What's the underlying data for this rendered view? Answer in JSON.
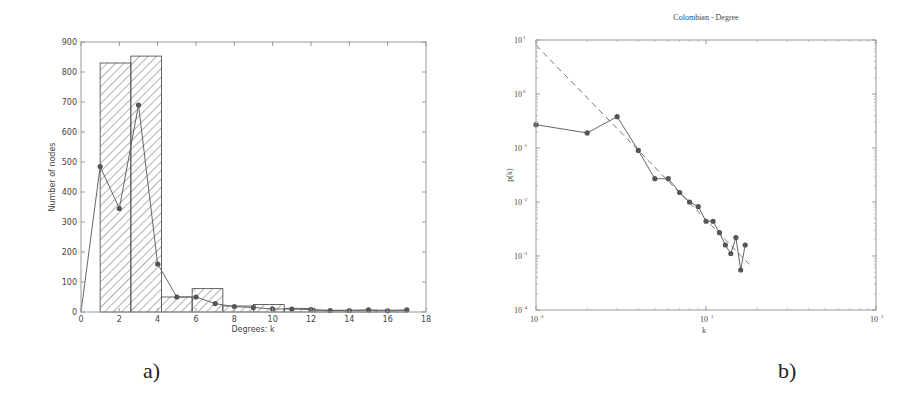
{
  "panels": {
    "a_label": "a)",
    "b_label": "b)"
  },
  "chart_data": [
    {
      "type": "bar",
      "panel": "a)",
      "title": "",
      "xlabel": "Degrees: k",
      "ylabel": "Number of nodes",
      "xlim": [
        0,
        18
      ],
      "ylim": [
        0,
        900
      ],
      "xticks": [
        0,
        2,
        4,
        6,
        8,
        10,
        12,
        14,
        16,
        18
      ],
      "yticks": [
        0,
        100,
        200,
        300,
        400,
        500,
        600,
        700,
        800,
        900
      ],
      "grid": false,
      "histogram": {
        "style": "hatched",
        "bins": [
          {
            "x0": 1.0,
            "x1": 2.6,
            "value": 830
          },
          {
            "x0": 2.6,
            "x1": 4.2,
            "value": 853
          },
          {
            "x0": 4.2,
            "x1": 5.8,
            "value": 50
          },
          {
            "x0": 5.8,
            "x1": 7.4,
            "value": 78
          },
          {
            "x0": 7.4,
            "x1": 9.0,
            "value": 20
          },
          {
            "x0": 9.0,
            "x1": 10.6,
            "value": 25
          },
          {
            "x0": 10.6,
            "x1": 12.2,
            "value": 12
          },
          {
            "x0": 12.2,
            "x1": 13.8,
            "value": 6
          },
          {
            "x0": 13.8,
            "x1": 15.4,
            "value": 6
          },
          {
            "x0": 15.4,
            "x1": 17.0,
            "value": 6
          }
        ]
      },
      "series": [
        {
          "name": "degree count",
          "x": [
            0,
            1,
            2,
            3,
            4,
            5,
            6,
            7,
            8,
            9,
            10,
            11,
            12,
            13,
            14,
            15,
            16,
            17
          ],
          "values": [
            0,
            485,
            345,
            690,
            160,
            50,
            50,
            28,
            18,
            15,
            10,
            10,
            8,
            5,
            5,
            7,
            4,
            7
          ],
          "marker": "circle"
        }
      ]
    },
    {
      "type": "line",
      "panel": "b)",
      "title": "Colombian - Degree",
      "xlabel": "k",
      "ylabel": "p(k)",
      "xscale": "log",
      "yscale": "log",
      "xlim": [
        1,
        100
      ],
      "ylim": [
        0.0001,
        10
      ],
      "xtick_labels": [
        "10^0",
        "10^1",
        "10^2"
      ],
      "ytick_labels": [
        "10^1",
        "10^0",
        "10^-1",
        "10^-2",
        "10^-3",
        "10^-4"
      ],
      "grid": false,
      "series": [
        {
          "name": "p(k)",
          "marker": "circle",
          "x": [
            1,
            2,
            3,
            4,
            5,
            6,
            7,
            8,
            9,
            10,
            11,
            12,
            13,
            14,
            15,
            16,
            17
          ],
          "values": [
            0.27,
            0.19,
            0.38,
            0.09,
            0.027,
            0.027,
            0.015,
            0.01,
            0.0082,
            0.0044,
            0.0044,
            0.0027,
            0.0016,
            0.0011,
            0.0022,
            0.00055,
            0.0016
          ]
        },
        {
          "name": "power-law fit",
          "style": "dashed",
          "x": [
            1,
            18
          ],
          "values": [
            8.0,
            0.0007
          ]
        }
      ]
    }
  ]
}
